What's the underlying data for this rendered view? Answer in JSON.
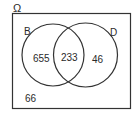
{
  "diagram": {
    "type": "venn",
    "universe_label": "Ω",
    "sets": [
      {
        "name": "B",
        "only_count": "655"
      },
      {
        "name": "D",
        "only_count": "46"
      }
    ],
    "intersection_count": "233",
    "outside_count": "66"
  }
}
